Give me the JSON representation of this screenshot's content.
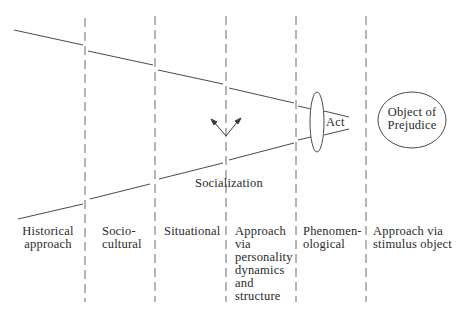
{
  "diagram": {
    "columns": [
      {
        "label_lines": [
          "Historical",
          "approach"
        ]
      },
      {
        "label_lines": [
          "Socio-",
          "cultural"
        ]
      },
      {
        "label_lines": [
          "Situational"
        ]
      },
      {
        "label_lines": [
          "Approach",
          "via",
          "personality",
          "dynamics",
          "and",
          "structure"
        ]
      },
      {
        "label_lines": [
          "Phenomen-",
          "ological"
        ]
      },
      {
        "label_lines": [
          "Approach via",
          "stimulus object"
        ]
      }
    ],
    "socialization_label": "Socialization",
    "act_label": "Act",
    "object_label_lines": [
      "Object of",
      "Prejudice"
    ],
    "colors": {
      "line": "#4a4a4a",
      "text": "#2a2a2a",
      "background": "#ffffff"
    }
  }
}
